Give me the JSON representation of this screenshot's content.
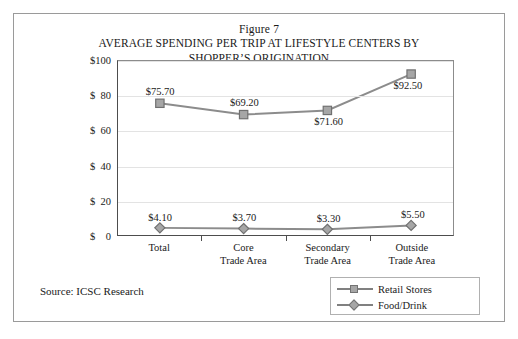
{
  "figure": {
    "number": "Figure 7",
    "title_line1": "AVERAGE SPENDING PER TRIP AT LIFESTYLE CENTERS BY",
    "title_line2": "SHOPPER’S ORIGINATION",
    "source": "Source: ICSC Research"
  },
  "legend": {
    "position": "bottom-right",
    "entries": [
      {
        "label": "Retail Stores",
        "marker": "square",
        "color": "#a6a6a6"
      },
      {
        "label": "Food/Drink",
        "marker": "diamond",
        "color": "#a6a6a6"
      }
    ]
  },
  "chart_data": {
    "type": "line",
    "title": "AVERAGE SPENDING PER TRIP AT LIFESTYLE CENTERS BY SHOPPER’S ORIGINATION",
    "subtitle": "Figure 7",
    "xlabel": "",
    "ylabel": "",
    "categories": [
      "Total",
      "Core\nTrade Area",
      "Secondary\nTrade Area",
      "Outside\nTrade Area"
    ],
    "category_lines": [
      [
        "Total",
        ""
      ],
      [
        "Core",
        "Trade Area"
      ],
      [
        "Secondary",
        "Trade Area"
      ],
      [
        "Outside",
        "Trade Area"
      ]
    ],
    "series": [
      {
        "name": "Retail Stores",
        "marker": "square",
        "values": [
          75.7,
          69.2,
          71.6,
          92.5
        ],
        "labels": [
          "$75.70",
          "$69.20",
          "$71.60",
          "$92.50"
        ]
      },
      {
        "name": "Food/Drink",
        "marker": "diamond",
        "values": [
          4.1,
          3.7,
          3.3,
          5.5
        ],
        "labels": [
          "$4.10",
          "$3.70",
          "$3.30",
          "$5.50"
        ]
      }
    ],
    "ylim": [
      0,
      100
    ],
    "yticks": [
      0,
      20,
      40,
      60,
      80,
      100
    ],
    "ytick_labels": [
      "$    0",
      "$  20",
      "$  40",
      "$  60",
      "$  80",
      "$100"
    ],
    "grid": true,
    "grid_axis": "y",
    "legend_position": "bottom-right"
  }
}
